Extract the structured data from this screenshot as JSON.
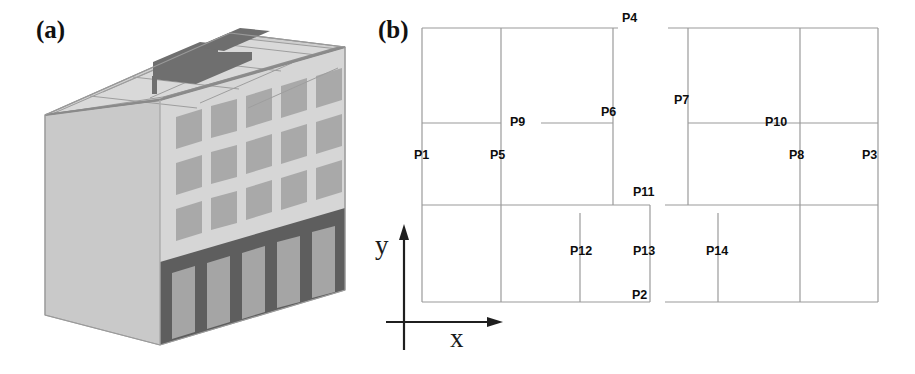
{
  "figure": {
    "panels": [
      {
        "id": "a",
        "label": "(a)",
        "caption_x": 36,
        "caption_y": 16,
        "content": "axonometric-building-model"
      },
      {
        "id": "b",
        "label": "(b)",
        "caption_x": 378,
        "caption_y": 16,
        "content": "floor-plan-with-measurement-points"
      }
    ]
  },
  "building": {
    "description": "Five-storey rectangular office block, axonometric view, flat roof with parapet and roof-slab grid, blank left gable wall, right facade with regular window grid, dark open ground-floor colonnade (soft storey).",
    "storeys": 5,
    "window_columns": 6,
    "window_rows": 3,
    "ground_floor_columns": 6,
    "colors": {
      "wall_left": "#c9c9c9",
      "wall_right": "#d3d3d3",
      "wall_front_light": "#dcdcdc",
      "window": "#a8a8a8",
      "roof_slab": "#c2c2c2",
      "roof_top_light": "#d8d8d8",
      "roof_recess_dark": "#6f6f6f",
      "parapet": "#8e8e8e",
      "ground_floor_dark": "#5e5e5e",
      "ground_floor_opening": "#a5a5a5",
      "outline": "#8a8a8a"
    }
  },
  "plan": {
    "title": "(b)",
    "axes": {
      "x_label": "x",
      "y_label": "y",
      "origin_x": 404,
      "origin_y": 322
    },
    "line_color": "#9a9a9a",
    "label_color": "#0d0d0d",
    "blocks": [
      {
        "name": "left-block",
        "x1": 422,
        "y1": 28,
        "x2": 618,
        "y2": 302
      },
      {
        "name": "right-block",
        "x1": 668,
        "y1": 28,
        "x2": 878,
        "y2": 302
      }
    ],
    "points": [
      {
        "id": "P1",
        "label": "P1",
        "label_x": 414,
        "label_y": 156,
        "node_x": 422,
        "node_y": 170
      },
      {
        "id": "P2",
        "label": "P2",
        "label_x": 632,
        "label_y": 294,
        "node_x": 650,
        "node_y": 302
      },
      {
        "id": "P3",
        "label": "P3",
        "label_x": 862,
        "label_y": 156,
        "node_x": 878,
        "node_y": 170
      },
      {
        "id": "P4",
        "label": "P4",
        "label_x": 622,
        "label_y": 18,
        "node_x": 613,
        "node_y": 28
      },
      {
        "id": "P5",
        "label": "P5",
        "label_x": 490,
        "label_y": 156,
        "node_x": 501,
        "node_y": 170
      },
      {
        "id": "P6",
        "label": "P6",
        "label_x": 601,
        "label_y": 112,
        "node_x": 613,
        "node_y": 123
      },
      {
        "id": "P7",
        "label": "P7",
        "label_x": 674,
        "label_y": 100,
        "node_x": 688,
        "node_y": 123
      },
      {
        "id": "P8",
        "label": "P8",
        "label_x": 789,
        "label_y": 156,
        "node_x": 800,
        "node_y": 170
      },
      {
        "id": "P9",
        "label": "P9",
        "label_x": 511,
        "label_y": 117,
        "node_x": 501,
        "node_y": 123
      },
      {
        "id": "P10",
        "label": "P10",
        "label_x": 765,
        "label_y": 117,
        "node_x": 800,
        "node_y": 123
      },
      {
        "id": "P11",
        "label": "P11",
        "label_x": 633,
        "label_y": 190,
        "node_x": 650,
        "node_y": 205
      },
      {
        "id": "P12",
        "label": "P12",
        "label_x": 570,
        "label_y": 248,
        "node_x": 580,
        "node_y": 253
      },
      {
        "id": "P13",
        "label": "P13",
        "label_x": 633,
        "label_y": 248,
        "node_x": 650,
        "node_y": 253
      },
      {
        "id": "P14",
        "label": "P14",
        "label_x": 706,
        "label_y": 248,
        "node_x": 718,
        "node_y": 253
      }
    ]
  }
}
